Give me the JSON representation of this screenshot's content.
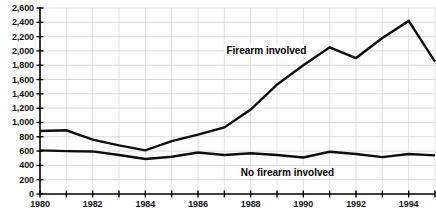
{
  "chart_data": {
    "type": "line",
    "title": "",
    "subtitle": "",
    "xlabel": "",
    "ylabel": "",
    "xlim": [
      1980,
      1995
    ],
    "ylim": [
      0,
      2600
    ],
    "grid": true,
    "legend_position": "inline-annotation",
    "x": [
      1980,
      1981,
      1982,
      1983,
      1984,
      1985,
      1986,
      1987,
      1988,
      1989,
      1990,
      1991,
      1992,
      1993,
      1994,
      1995
    ],
    "ytick_values": [
      0,
      200,
      400,
      600,
      800,
      1000,
      1200,
      1400,
      1600,
      1800,
      2000,
      2200,
      2400,
      2600
    ],
    "ytick_labels": [
      "0",
      "200",
      "400",
      "600",
      "800",
      "1,000",
      "1,200",
      "1,400",
      "1,600",
      "1,800",
      "2,000",
      "2,200",
      "2,400",
      "2,600"
    ],
    "xtick_values": [
      1980,
      1981,
      1982,
      1983,
      1984,
      1985,
      1986,
      1987,
      1988,
      1989,
      1990,
      1991,
      1992,
      1993,
      1994,
      1995
    ],
    "xtick_labels": [
      "1980",
      "",
      "1982",
      "",
      "1984",
      "",
      "1986",
      "",
      "1988",
      "",
      "1990",
      "",
      "1992",
      "",
      "1994",
      ""
    ],
    "series": [
      {
        "name": "Firearm involved",
        "color": "#0d0d0d",
        "label_x": 1988.6,
        "label_y": 2010,
        "values": [
          880,
          890,
          760,
          680,
          610,
          740,
          830,
          930,
          1180,
          1530,
          1800,
          2050,
          1900,
          2180,
          2420,
          1850
        ]
      },
      {
        "name": "No firearm involved",
        "color": "#0d0d0d",
        "label_x": 1989.4,
        "label_y": 310,
        "values": [
          610,
          600,
          595,
          545,
          490,
          520,
          580,
          545,
          570,
          545,
          510,
          590,
          560,
          515,
          560,
          540
        ]
      }
    ]
  },
  "axis_colors": {
    "axis": "#000000",
    "grid": "#c9c9c9",
    "series": "#0d0d0d"
  }
}
